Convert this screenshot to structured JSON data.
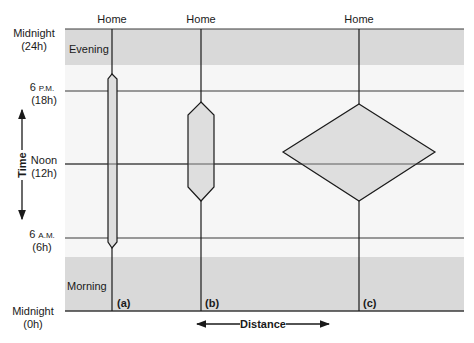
{
  "colors": {
    "band": "#d9d9d9",
    "plot_bg": "#f6f6f6",
    "line": "#1a1a1a",
    "prism_fill": "#dedede"
  },
  "time_axis": {
    "label": "Time",
    "ticks": [
      {
        "name": "Midnight",
        "sub": "(24h)",
        "y": 29
      },
      {
        "name": "6",
        "small": "P.M.",
        "sub": "(18h)",
        "y": 91
      },
      {
        "name": "Noon",
        "sub": "(12h)",
        "y": 164
      },
      {
        "name": "6",
        "small": "A.M.",
        "sub": "(6h)",
        "y": 238
      },
      {
        "name": "Midnight",
        "sub": "(0h)",
        "y": 311
      }
    ]
  },
  "distance_axis": {
    "label": "Distance"
  },
  "bands": [
    {
      "label": "Evening",
      "top": 29,
      "bottom": 65
    },
    {
      "label": "Morning",
      "top": 257,
      "bottom": 311
    }
  ],
  "paths": [
    {
      "id": "a",
      "label": "(a)",
      "top_label": "Home",
      "x": 112
    },
    {
      "id": "b",
      "label": "(b)",
      "top_label": "Home",
      "x": 201
    },
    {
      "id": "c",
      "label": "(c)",
      "top_label": "Home",
      "x": 359
    }
  ]
}
